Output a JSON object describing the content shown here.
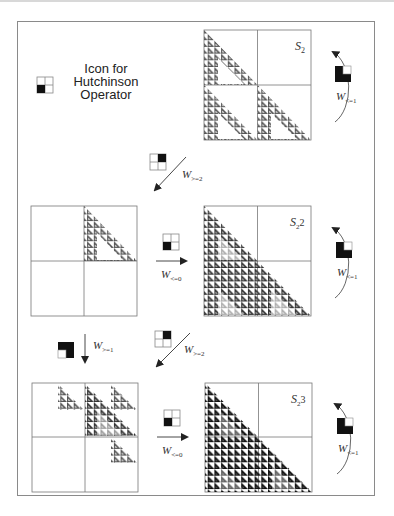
{
  "legend": {
    "icon_caption_line1": "Icon for",
    "icon_caption_line2": "Hutchinson",
    "icon_caption_line3": "Operator",
    "icon_name": "hutchinson-operator-icon"
  },
  "panels": [
    {
      "id": "S2",
      "label": "S",
      "subscript": "2",
      "superscript": "",
      "position": "top-right",
      "fill_color": "#555555"
    },
    {
      "id": "W_ge2_of_S2",
      "label": "",
      "position": "middle-left"
    },
    {
      "id": "S2^2",
      "label": "S",
      "subscript": "2",
      "superscript": "2",
      "position": "middle-right",
      "fill_color": "#333333"
    },
    {
      "id": "W_ge1_of_S2^2",
      "label": "",
      "position": "bottom-left"
    },
    {
      "id": "S2^3",
      "label": "S",
      "subscript": "2",
      "superscript": "3",
      "position": "bottom-right",
      "fill_color": "#111111"
    }
  ],
  "arrows": [
    {
      "id": "top-diag",
      "label": "W",
      "subscript": ">=2",
      "direction": "down-left"
    },
    {
      "id": "mid-horizontal",
      "label": "W",
      "subscript": "<=0",
      "direction": "right"
    },
    {
      "id": "bottom-down",
      "label": "W",
      "subscript": ">=1",
      "direction": "down"
    },
    {
      "id": "bottom-diag",
      "label": "W",
      "subscript": ">=2",
      "direction": "down-left"
    },
    {
      "id": "bottom-horizontal",
      "label": "W",
      "subscript": "<=0",
      "direction": "right"
    },
    {
      "id": "loop-top",
      "label": "W",
      "subscript": "<=1",
      "direction": "counterclockwise"
    },
    {
      "id": "loop-mid",
      "label": "W",
      "subscript": "<=1",
      "direction": "counterclockwise"
    },
    {
      "id": "loop-bottom",
      "label": "W",
      "subscript": "<=1",
      "direction": "counterclockwise"
    }
  ],
  "labels": {
    "S2_main": "S",
    "S2_sub": "2",
    "S22_sup": "2",
    "S23_sup": "3",
    "W": "W",
    "sub_ge2": ">=2",
    "sub_le0": "<=0",
    "sub_ge1": ">=1",
    "sub_le1": "<=1"
  }
}
